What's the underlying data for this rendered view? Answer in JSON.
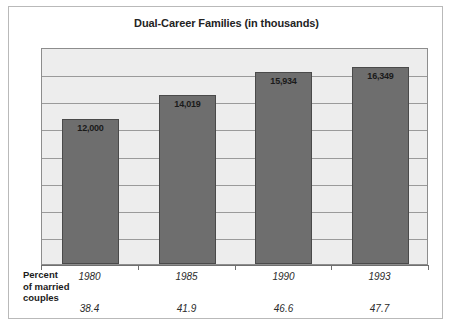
{
  "figure": {
    "title": "Dual-Career Families (in thousands)",
    "row_label_lines": [
      "Percent",
      "of married",
      "couples"
    ],
    "colors": {
      "bar_fill": "#6e6e6e",
      "bar_edge": "#4a4a4a",
      "plot_background": "#ededed",
      "gridline": "#9a9a9a",
      "frame": "#b9b9b9",
      "text": "#1b1b1b"
    }
  },
  "chart_data": {
    "type": "bar",
    "title": "Dual-Career Families (in thousands)",
    "xlabel": "",
    "ylabel": "",
    "categories": [
      "1980",
      "1985",
      "1990",
      "1993"
    ],
    "values": [
      12000,
      14019,
      15934,
      16349
    ],
    "value_labels": [
      "12,000",
      "14,019",
      "15,934",
      "16,349"
    ],
    "series": [
      {
        "name": "Dual-career families (in thousands)",
        "values": [
          12000,
          14019,
          15934,
          16349
        ]
      },
      {
        "name": "Percent of married couples",
        "values": [
          38.4,
          41.9,
          46.6,
          47.7
        ],
        "value_labels": [
          "38.4",
          "41.9",
          "46.6",
          "47.7"
        ]
      }
    ],
    "ylim": [
      0,
      18000
    ],
    "grid": true,
    "gridline_count": 8,
    "legend": "none"
  }
}
